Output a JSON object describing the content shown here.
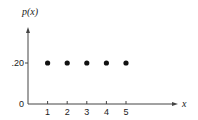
{
  "chart_data": {
    "type": "scatter",
    "title": "",
    "xlabel": "x",
    "ylabel": "p(x)",
    "x": [
      1,
      2,
      3,
      4,
      5
    ],
    "values": [
      0.2,
      0.2,
      0.2,
      0.2,
      0.2
    ],
    "x_tick_labels": [
      "1",
      "2",
      "3",
      "4",
      "5"
    ],
    "y_tick_labels": [
      {
        "value": 0,
        "label": "0"
      },
      {
        "value": 0.2,
        "label": ".20"
      }
    ],
    "xlim": [
      0,
      6
    ],
    "ylim": [
      0,
      0.38
    ],
    "grid": false,
    "legend": "none"
  }
}
